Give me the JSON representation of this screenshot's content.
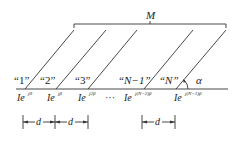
{
  "diagram": {
    "top_label": "M",
    "angle_label": "α",
    "ellipsis": "···",
    "dimension_label": "d",
    "elements": [
      {
        "label": "“1”",
        "current_base": "Ie",
        "current_exp": "j0"
      },
      {
        "label": "“2”",
        "current_base": "Ie",
        "current_exp": "jβ"
      },
      {
        "label": "“3”",
        "current_base": "Ie",
        "current_exp": "j2β"
      },
      {
        "label": "“N−1”",
        "current_base": "Ie",
        "current_exp": "j(N−2)β"
      },
      {
        "label": "“N”",
        "current_base": "Ie",
        "current_exp": "j(N−1)β"
      }
    ],
    "colors": {
      "stroke": "#333333",
      "text": "#222222",
      "background": "#ffffff"
    }
  }
}
